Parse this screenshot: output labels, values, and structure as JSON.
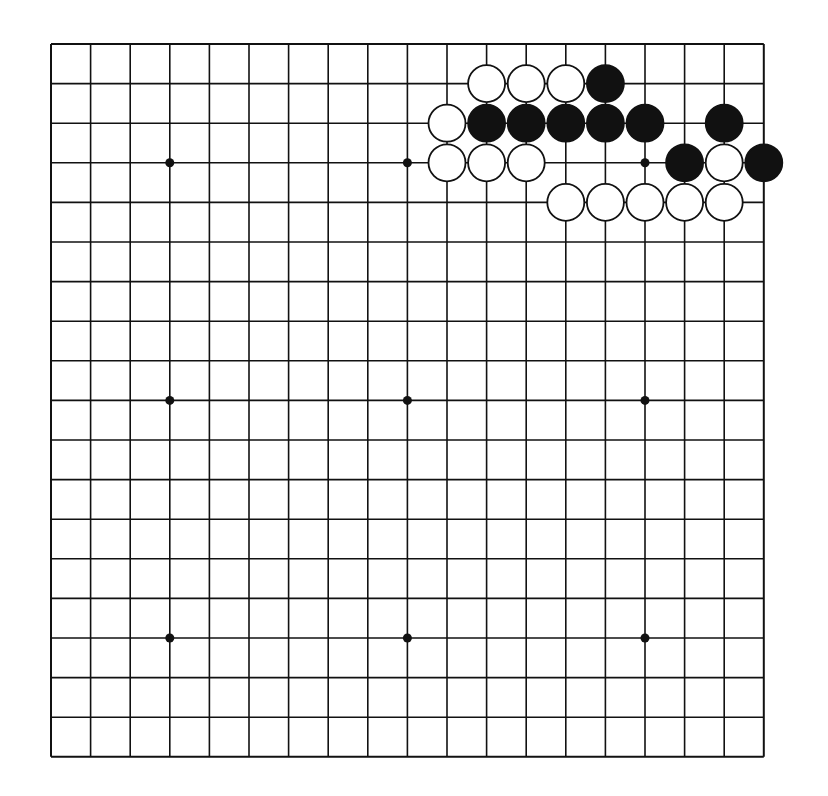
{
  "diagram": {
    "type": "go-board",
    "size": 19,
    "origin": {
      "x": 51,
      "y": 44
    },
    "spacing": 39.6,
    "line_color": "#111111",
    "black_color": "#111111",
    "white_color": "#ffffff",
    "hoshi": [
      [
        3,
        3
      ],
      [
        9,
        3
      ],
      [
        15,
        3
      ],
      [
        3,
        9
      ],
      [
        9,
        9
      ],
      [
        15,
        9
      ],
      [
        3,
        15
      ],
      [
        9,
        15
      ],
      [
        15,
        15
      ]
    ],
    "stones": [
      {
        "col": 11,
        "row": 1,
        "color": "white"
      },
      {
        "col": 12,
        "row": 1,
        "color": "white"
      },
      {
        "col": 13,
        "row": 1,
        "color": "white"
      },
      {
        "col": 14,
        "row": 1,
        "color": "black"
      },
      {
        "col": 10,
        "row": 2,
        "color": "white"
      },
      {
        "col": 11,
        "row": 2,
        "color": "black"
      },
      {
        "col": 12,
        "row": 2,
        "color": "black"
      },
      {
        "col": 13,
        "row": 2,
        "color": "black"
      },
      {
        "col": 14,
        "row": 2,
        "color": "black"
      },
      {
        "col": 15,
        "row": 2,
        "color": "black"
      },
      {
        "col": 17,
        "row": 2,
        "color": "black"
      },
      {
        "col": 10,
        "row": 3,
        "color": "white"
      },
      {
        "col": 11,
        "row": 3,
        "color": "white"
      },
      {
        "col": 12,
        "row": 3,
        "color": "white"
      },
      {
        "col": 16,
        "row": 3,
        "color": "black"
      },
      {
        "col": 17,
        "row": 3,
        "color": "white"
      },
      {
        "col": 18,
        "row": 3,
        "color": "black"
      },
      {
        "col": 13,
        "row": 4,
        "color": "white"
      },
      {
        "col": 14,
        "row": 4,
        "color": "white"
      },
      {
        "col": 15,
        "row": 4,
        "color": "white"
      },
      {
        "col": 16,
        "row": 4,
        "color": "white"
      },
      {
        "col": 17,
        "row": 4,
        "color": "white"
      }
    ]
  }
}
